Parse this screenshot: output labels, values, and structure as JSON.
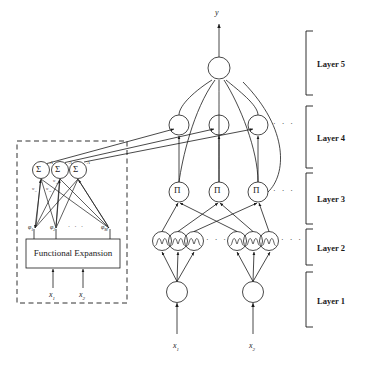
{
  "figure": {
    "type": "neural-network-architecture-diagram",
    "output_label": "y",
    "dashed_block_title": "Functional Expansion",
    "ellipsis": "· · ·"
  },
  "layer_labels": [
    {
      "id": "layer5",
      "label": "Layer 5"
    },
    {
      "id": "layer4",
      "label": "Layer 4"
    },
    {
      "id": "layer3",
      "label": "Layer 3"
    },
    {
      "id": "layer2",
      "label": "Layer 2"
    },
    {
      "id": "layer1",
      "label": "Layer 1"
    }
  ],
  "layers": {
    "layer5": {
      "name": "Layer 5",
      "node_count": 1,
      "node_glyph": "",
      "node_type": "circle-empty",
      "output": "y"
    },
    "layer4": {
      "name": "Layer 4",
      "node_count": 3,
      "node_glyph": "",
      "node_type": "circle-empty",
      "trailing_ellipsis": "· · ·"
    },
    "layer3": {
      "name": "Layer 3",
      "node_count": 3,
      "node_glyph": "Π",
      "node_type": "circle-product",
      "trailing_ellipsis": "· · ·"
    },
    "layer2": {
      "name": "Layer 2",
      "node_count": 6,
      "node_glyph": "bell-membership",
      "node_type": "circle-membership",
      "inner_ellipsis": "· · ·",
      "trailing_ellipsis": "· · ·"
    },
    "layer1": {
      "name": "Layer 1",
      "node_count": 2,
      "node_glyph": "",
      "node_type": "circle-empty",
      "inputs": [
        "x",
        "x"
      ]
    }
  },
  "inputs": {
    "bottom_left": {
      "base": "x",
      "sub": "1"
    },
    "bottom_right": {
      "base": "x",
      "sub": "2"
    }
  },
  "fe_block": {
    "title": "Functional Expansion",
    "inputs": [
      {
        "base": "x",
        "sub": "1"
      },
      {
        "base": "x",
        "sub": "2"
      }
    ],
    "phi_nodes": [
      {
        "base": "φ",
        "sub": "1"
      },
      {
        "base": "φ",
        "sub": "2"
      },
      {
        "base": "φ",
        "sub": "M"
      }
    ],
    "phi_ellipsis": "· · ·",
    "sum_nodes": [
      {
        "glyph": "Σ",
        "sup": "A"
      },
      {
        "glyph": "Σ",
        "sup": "A"
      },
      {
        "glyph": "Σ",
        "sup": "A"
      }
    ],
    "weight_labels": [
      {
        "text": "w",
        "sub": "11"
      },
      {
        "text": "w",
        "sub": "12"
      },
      {
        "text": "w",
        "sub": "1M"
      }
    ]
  },
  "colors": {
    "stroke": "#1a1a1a",
    "background": "#ffffff",
    "text": "#1a1a1a"
  }
}
